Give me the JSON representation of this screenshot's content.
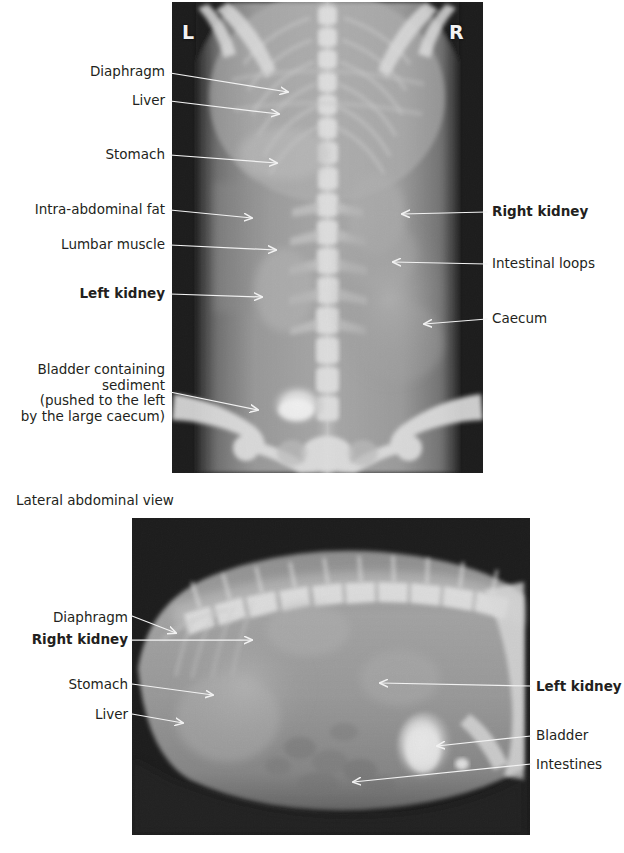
{
  "figure": {
    "title_visible": false,
    "background": "#ffffff",
    "ink_color": "#231f20",
    "arrow_color": "#f2f2f2"
  },
  "views": [
    {
      "id": "ventrodorsal",
      "caption": "",
      "orientation_marks": [
        {
          "name": "left-marker",
          "text": "L"
        },
        {
          "name": "right-marker",
          "text": "R"
        }
      ],
      "labels_left": [
        {
          "text": "Diaphragm",
          "bold": false
        },
        {
          "text": "Liver",
          "bold": false
        },
        {
          "text": "Stomach",
          "bold": false
        },
        {
          "text": "Intra-abdominal fat",
          "bold": false
        },
        {
          "text": "Lumbar muscle",
          "bold": false
        },
        {
          "text": "Left kidney",
          "bold": true
        },
        {
          "text": "Bladder containing\nsediment\n(pushed to the left\nby the large caecum)",
          "bold": false
        }
      ],
      "labels_right": [
        {
          "text": "Right kidney",
          "bold": true
        },
        {
          "text": "Intestinal loops",
          "bold": false
        },
        {
          "text": "Caecum",
          "bold": false
        }
      ]
    },
    {
      "id": "lateral",
      "caption": "Lateral abdominal view",
      "orientation_marks": [],
      "labels_left": [
        {
          "text": "Diaphragm",
          "bold": false
        },
        {
          "text": "Right kidney",
          "bold": true
        },
        {
          "text": "Stomach",
          "bold": false
        },
        {
          "text": "Liver",
          "bold": false
        }
      ],
      "labels_right": [
        {
          "text": "Left kidney",
          "bold": true
        },
        {
          "text": "Bladder",
          "bold": false
        },
        {
          "text": "Intestines",
          "bold": false
        }
      ]
    }
  ]
}
